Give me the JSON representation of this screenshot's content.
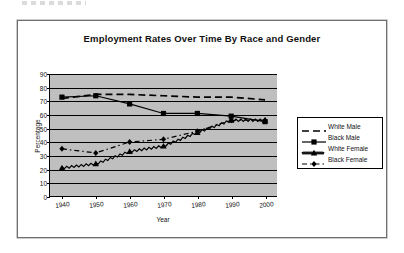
{
  "chart_data": {
    "type": "line",
    "title": "Employment Rates Over Time By Race and Gender",
    "xlabel": "Year",
    "ylabel": "Percentage",
    "x": [
      1940,
      1950,
      1960,
      1970,
      1980,
      1990,
      2000
    ],
    "xtick_labels": [
      "1940",
      "1950",
      "1960",
      "1970",
      "1980",
      "1990",
      "2000"
    ],
    "ytick_labels": [
      "0",
      "10",
      "20",
      "30",
      "40",
      "50",
      "60",
      "70",
      "80",
      "90"
    ],
    "ylim": [
      0,
      90
    ],
    "ytick_step": 10,
    "xlim": [
      1940,
      2000
    ],
    "grid": "horizontal",
    "legend_position": "right-outside",
    "plot_background": "#bfbfbf",
    "line_color": "#000000",
    "series": [
      {
        "name": "White Male",
        "style": "long-dash",
        "marker": "none",
        "values": [
          72,
          75,
          75,
          74,
          73,
          73,
          71
        ]
      },
      {
        "name": "Black Male",
        "style": "solid",
        "marker": "square",
        "values": [
          73,
          74,
          68,
          61,
          61,
          59,
          55
        ]
      },
      {
        "name": "White Female",
        "style": "zigzag",
        "marker": "triangle",
        "values": [
          21,
          24,
          33,
          37,
          47,
          56,
          56
        ]
      },
      {
        "name": "Black Female",
        "style": "dash-dot",
        "marker": "diamond",
        "values": [
          35,
          32,
          40,
          42,
          48,
          56,
          56
        ]
      }
    ]
  },
  "legend": {
    "items": [
      {
        "label": "White Male"
      },
      {
        "label": "Black Male"
      },
      {
        "label": "White Female"
      },
      {
        "label": "Black Female"
      }
    ]
  }
}
